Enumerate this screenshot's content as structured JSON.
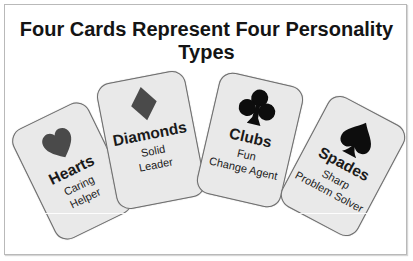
{
  "title": "Four Cards Represent Four Personality Types",
  "cards": [
    {
      "suit": "heart-icon",
      "name": "Hearts",
      "line1": "Caring",
      "line2": "Helper",
      "suit_color": "#4a4a4a"
    },
    {
      "suit": "diamond-icon",
      "name": "Diamonds",
      "line1": "Solid",
      "line2": "Leader",
      "suit_color": "#4a4a4a"
    },
    {
      "suit": "club-icon",
      "name": "Clubs",
      "line1": "Fun",
      "line2": "Change Agent",
      "suit_color": "#0d0d0d"
    },
    {
      "suit": "spade-icon",
      "name": "Spades",
      "line1": "Sharp",
      "line2": "Problem Solver",
      "suit_color": "#0d0d0d"
    }
  ],
  "colors": {
    "card_fill": "#e9e9e9",
    "card_border": "#6e6e6e",
    "frame_border": "#b9b9b9"
  }
}
